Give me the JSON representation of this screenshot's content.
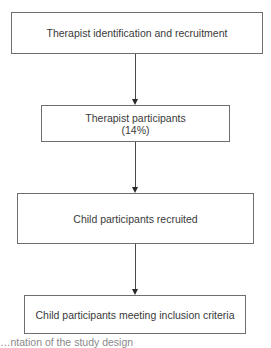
{
  "flowchart": {
    "nodes": [
      {
        "id": "therapist-identification",
        "lines": [
          "Therapist identification and recruitment"
        ]
      },
      {
        "id": "therapist-participants",
        "lines": [
          "Therapist participants",
          "(14%)"
        ]
      },
      {
        "id": "child-recruited",
        "lines": [
          "Child participants recruited"
        ]
      },
      {
        "id": "child-inclusion",
        "lines": [
          "Child participants meeting inclusion criteria"
        ]
      }
    ],
    "edges": [
      {
        "from": "therapist-identification",
        "to": "therapist-participants"
      },
      {
        "from": "therapist-participants",
        "to": "child-recruited"
      },
      {
        "from": "child-recruited",
        "to": "child-inclusion"
      }
    ]
  },
  "caption": {
    "text": "…ntation of the study design"
  },
  "colors": {
    "border": "#6e6e6e",
    "text": "#3a3a3a",
    "arrow": "#2a2a2a"
  }
}
